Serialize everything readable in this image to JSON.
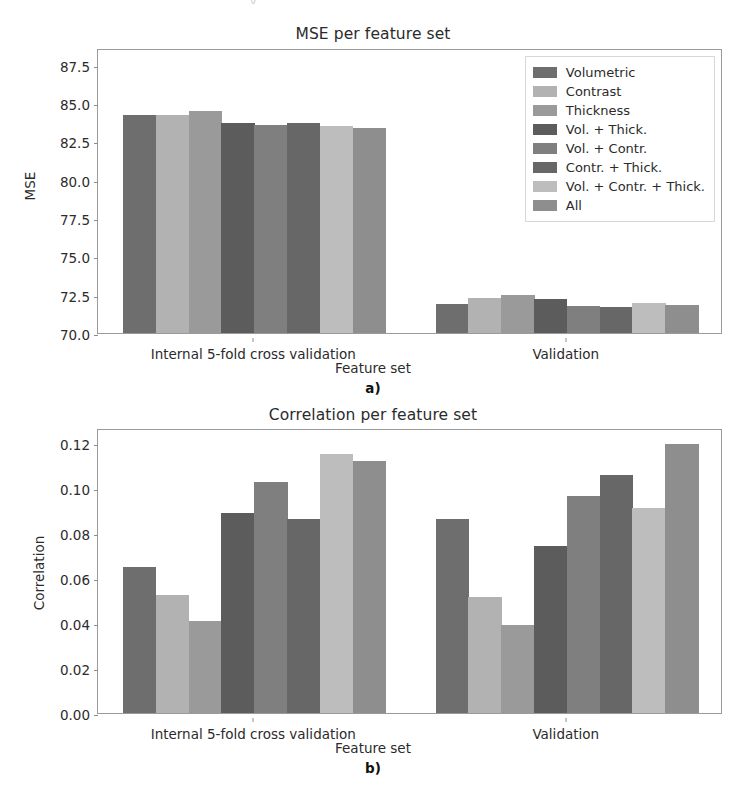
{
  "figure": {
    "top_sliver_text": "y                                                     ",
    "panels": [
      {
        "letter": "a)",
        "title": "MSE per feature set",
        "xlabel": "Feature set",
        "ylabel": "MSE"
      },
      {
        "letter": "b)",
        "title": "Correlation per feature set",
        "xlabel": "Feature set",
        "ylabel": "Correlation"
      }
    ]
  },
  "legend": {
    "position": "upper right",
    "entries": [
      {
        "label": "Volumetric",
        "color": "#6e6e6e"
      },
      {
        "label": "Contrast",
        "color": "#b2b2b2"
      },
      {
        "label": "Thickness",
        "color": "#9a9a9a"
      },
      {
        "label": "Vol. + Thick.",
        "color": "#5c5c5c"
      },
      {
        "label": "Vol. + Contr.",
        "color": "#7f7f7f"
      },
      {
        "label": "Contr. + Thick.",
        "color": "#676767"
      },
      {
        "label": "Vol. + Contr. + Thick.",
        "color": "#bdbdbd"
      },
      {
        "label": "All",
        "color": "#8e8e8e"
      }
    ]
  },
  "chart_data": [
    {
      "type": "bar",
      "title": "MSE per feature set",
      "xlabel": "Feature set",
      "ylabel": "MSE",
      "categories": [
        "Internal 5-fold cross validation",
        "Validation"
      ],
      "yticks": [
        "70.0",
        "72.5",
        "75.0",
        "77.5",
        "80.0",
        "82.5",
        "85.0",
        "87.5"
      ],
      "ytick_values": [
        70.0,
        72.5,
        75.0,
        77.5,
        80.0,
        82.5,
        85.0,
        87.5
      ],
      "ylim": [
        70.0,
        88.6
      ],
      "grid": false,
      "legend_position": "upper right",
      "series": [
        {
          "name": "Volumetric",
          "color": "#6e6e6e",
          "values": [
            84.2,
            71.9
          ]
        },
        {
          "name": "Contrast",
          "color": "#b2b2b2",
          "values": [
            84.25,
            72.3
          ]
        },
        {
          "name": "Thickness",
          "color": "#9a9a9a",
          "values": [
            84.5,
            72.45
          ]
        },
        {
          "name": "Vol. + Thick.",
          "color": "#5c5c5c",
          "values": [
            83.7,
            72.2
          ]
        },
        {
          "name": "Vol. + Contr.",
          "color": "#7f7f7f",
          "values": [
            83.6,
            71.75
          ]
        },
        {
          "name": "Contr. + Thick.",
          "color": "#676767",
          "values": [
            83.7,
            71.7
          ]
        },
        {
          "name": "Vol. + Contr. + Thick.",
          "color": "#bdbdbd",
          "values": [
            83.5,
            71.95
          ]
        },
        {
          "name": "All",
          "color": "#8e8e8e",
          "values": [
            83.35,
            71.8
          ]
        }
      ]
    },
    {
      "type": "bar",
      "title": "Correlation per feature set",
      "xlabel": "Feature set",
      "ylabel": "Correlation",
      "categories": [
        "Internal 5-fold cross validation",
        "Validation"
      ],
      "yticks": [
        "0.00",
        "0.02",
        "0.04",
        "0.06",
        "0.08",
        "0.10",
        "0.12"
      ],
      "ytick_values": [
        0.0,
        0.02,
        0.04,
        0.06,
        0.08,
        0.1,
        0.12
      ],
      "ylim": [
        0.0,
        0.1265
      ],
      "grid": false,
      "legend_position": "none",
      "series": [
        {
          "name": "Volumetric",
          "color": "#6e6e6e",
          "values": [
            0.065,
            0.086
          ]
        },
        {
          "name": "Contrast",
          "color": "#b2b2b2",
          "values": [
            0.0525,
            0.0515
          ]
        },
        {
          "name": "Thickness",
          "color": "#9a9a9a",
          "values": [
            0.041,
            0.039
          ]
        },
        {
          "name": "Vol. + Thick.",
          "color": "#5c5c5c",
          "values": [
            0.089,
            0.074
          ]
        },
        {
          "name": "Vol. + Contr.",
          "color": "#7f7f7f",
          "values": [
            0.1025,
            0.0965
          ]
        },
        {
          "name": "Contr. + Thick.",
          "color": "#676767",
          "values": [
            0.086,
            0.1055
          ]
        },
        {
          "name": "Vol. + Contr. + Thick.",
          "color": "#bdbdbd",
          "values": [
            0.115,
            0.091
          ]
        },
        {
          "name": "All",
          "color": "#8e8e8e",
          "values": [
            0.112,
            0.1195
          ]
        }
      ]
    }
  ]
}
